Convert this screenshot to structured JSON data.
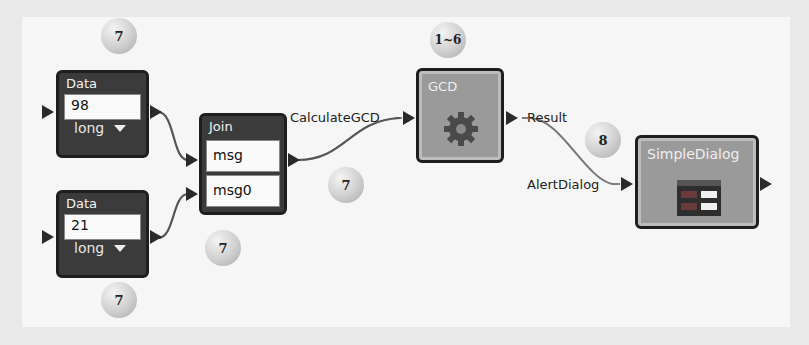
{
  "diagram": {
    "blocks": {
      "data1": {
        "title": "Data",
        "value": "98",
        "type": "long"
      },
      "data2": {
        "title": "Data",
        "value": "21",
        "type": "long"
      },
      "join": {
        "title": "Join",
        "inputs": [
          "msg",
          "msg0"
        ]
      },
      "gcd": {
        "title": "GCD",
        "icon": "gear-icon"
      },
      "dialog": {
        "title": "SimpleDialog",
        "icon": "dialog-form-icon"
      }
    },
    "labels": {
      "calculate": "CalculateGCD",
      "result": "Result",
      "alert": "AlertDialog"
    },
    "badges": {
      "data1_top": "7",
      "data2_bottom": "7",
      "join_bottom": "7",
      "join_right": "7",
      "gcd_top": "1~6",
      "dialog_left": "8"
    },
    "colors": {
      "dark_block": "#3b3b3b",
      "gray_block": "#9a9a9a",
      "canvas": "#f6f6f6"
    }
  }
}
